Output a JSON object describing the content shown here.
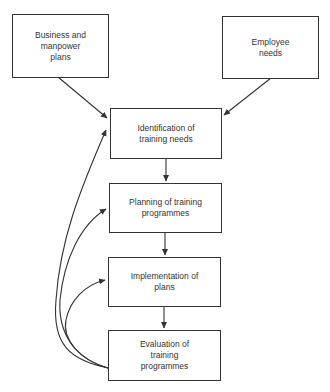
{
  "diagram": {
    "type": "flowchart",
    "nodes": [
      {
        "id": "business",
        "label": "Business and\nmanpower\nplans"
      },
      {
        "id": "employee",
        "label": "Employee\nneeds"
      },
      {
        "id": "identification",
        "label": "Identification of\ntraining needs"
      },
      {
        "id": "planning",
        "label": "Planning of training\nprogrammes"
      },
      {
        "id": "implementation",
        "label": "Implementation of\nplans"
      },
      {
        "id": "evaluation",
        "label": "Evaluation of\ntraining\nprogrammes"
      }
    ],
    "edges": [
      {
        "from": "business",
        "to": "identification"
      },
      {
        "from": "employee",
        "to": "identification"
      },
      {
        "from": "identification",
        "to": "planning"
      },
      {
        "from": "planning",
        "to": "implementation"
      },
      {
        "from": "implementation",
        "to": "evaluation"
      },
      {
        "from": "evaluation",
        "to": "identification",
        "style": "curved feedback"
      },
      {
        "from": "evaluation",
        "to": "planning",
        "style": "curved feedback"
      },
      {
        "from": "evaluation",
        "to": "implementation",
        "style": "curved feedback"
      }
    ]
  }
}
